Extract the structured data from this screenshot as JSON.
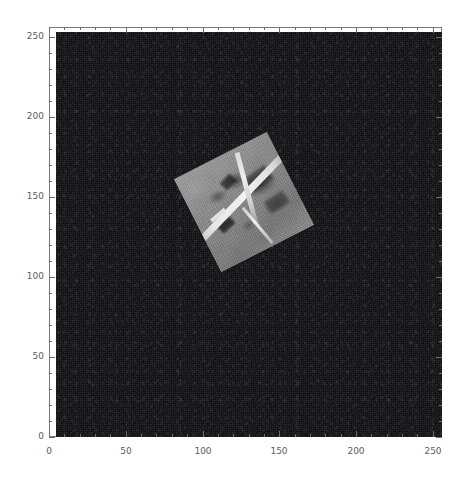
{
  "figure": {
    "width": 472,
    "height": 485,
    "background": "#ffffff"
  },
  "chart_data": {
    "type": "heatmap",
    "title": "",
    "xlabel": "",
    "ylabel": "",
    "xlim": [
      0,
      256
    ],
    "ylim": [
      0,
      256
    ],
    "grid": false,
    "legend": null,
    "colormap": "gray",
    "image_shape": [
      256,
      256
    ],
    "background_value": "near-zero (black) with low-amplitude noise",
    "xticks": [
      0,
      50,
      100,
      150,
      200,
      250
    ],
    "xticklabels": [
      "0",
      "50",
      "100",
      "150",
      "200",
      "250"
    ],
    "yticks": [
      0,
      50,
      100,
      150,
      200,
      250
    ],
    "yticklabels": [
      "0",
      "50",
      "100",
      "150",
      "200",
      "250"
    ],
    "minor_tick_interval": 10,
    "y_axis_direction": "bottom-to-top (origin lower)",
    "content_description": "A single bright grayscale aerial/satellite image patch rotated about -27 degrees, embedded on an otherwise dark noisy 256x256 canvas",
    "patch": {
      "shape": "square",
      "rotation_deg": -27,
      "side_length_px": 104,
      "center_xy_data": [
        100,
        168
      ],
      "corners_data": [
        [
          86,
          202
        ],
        [
          134,
          177
        ],
        [
          110,
          130
        ],
        [
          62,
          155
        ]
      ],
      "mean_intensity": 140,
      "features": [
        "bright diagonal runway / road",
        "perpendicular crossing road",
        "dark vegetation blobs",
        "thin bright linear streak"
      ]
    }
  },
  "axes": {
    "frame_color": "#7a7a7a",
    "tick_color": "#6e6e6e",
    "label_color": "#5d5d5d"
  }
}
